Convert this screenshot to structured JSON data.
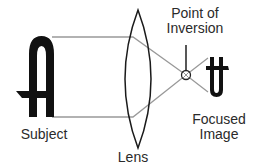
{
  "diagram": {
    "title": "",
    "labels": {
      "subject": "Subject",
      "lens": "Lens",
      "inversion_line1": "Point of",
      "inversion_line2": "Inversion",
      "image_line1": "Focused",
      "image_line2": "Image"
    },
    "colors": {
      "ray": "#999999",
      "ink": "#111111",
      "text": "#2a2a2a",
      "background": "#ffffff"
    }
  }
}
